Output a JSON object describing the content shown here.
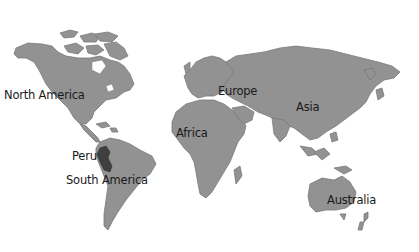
{
  "map": {
    "type": "world-continents",
    "background": "#ffffff",
    "land_color": "#929292",
    "highlight_color": "#3f3f3f",
    "highlighted_country": "Peru",
    "labels": [
      {
        "id": "north_america",
        "text": "North America",
        "x": 4,
        "y": 91
      },
      {
        "id": "europe",
        "text": "Europe",
        "x": 218,
        "y": 86
      },
      {
        "id": "asia",
        "text": "Asia",
        "x": 296,
        "y": 102
      },
      {
        "id": "africa",
        "text": "Africa",
        "x": 176,
        "y": 128
      },
      {
        "id": "peru",
        "text": "Peru",
        "x": 72,
        "y": 152
      },
      {
        "id": "south_america",
        "text": "South America",
        "x": 66,
        "y": 175
      },
      {
        "id": "australia",
        "text": "Australia",
        "x": 327,
        "y": 195
      }
    ]
  },
  "labels": {
    "north_america": "North America",
    "europe": "Europe",
    "asia": "Asia",
    "africa": "Africa",
    "peru": "Peru",
    "south_america": "South America",
    "australia": "Australia"
  }
}
